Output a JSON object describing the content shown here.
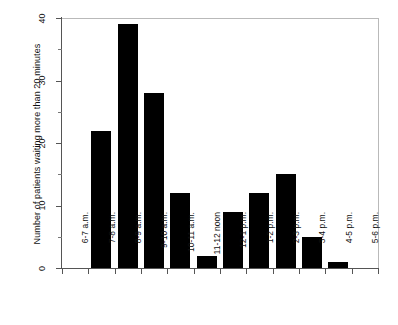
{
  "chart_data": {
    "type": "bar",
    "title": "",
    "subtitle": "",
    "xlabel": "",
    "ylabel": "Number of patients waiting more than 20 minutes",
    "categories": [
      "6-7 a.m.",
      "7-8 a.m.",
      "8-9 a.m.",
      "9-10 a.m.",
      "10-11 a.m.",
      "11-12 noon",
      "12-1 p.m.",
      "1-2 p.m.",
      "2-3 p.m.",
      "3-4 p.m.",
      "4-5 p.m.",
      "5-6 p.m."
    ],
    "values": [
      0,
      22,
      39,
      28,
      12,
      2,
      9,
      12,
      15,
      5,
      1,
      0
    ],
    "ylim": [
      0,
      40
    ],
    "yticks": [
      0,
      10,
      20,
      30,
      40
    ],
    "ytick_labels": [
      "0",
      "10",
      "20",
      "30",
      "40"
    ],
    "yminor_ticks": [
      5,
      15,
      25,
      35
    ],
    "grid": false,
    "legend": null,
    "bar_color": "#000000",
    "axis_color": "#555555",
    "frame_color": "#b9b9b9",
    "background_color": "#ffffff"
  }
}
